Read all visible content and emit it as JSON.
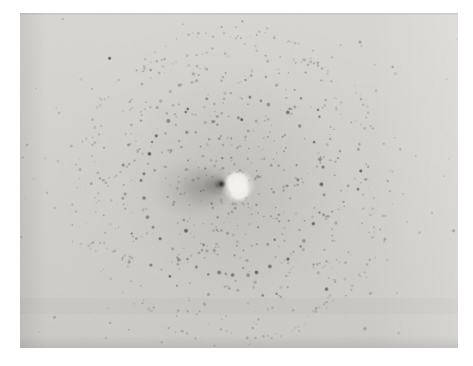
{
  "page": {
    "width": 473,
    "height": 366,
    "margin_color": "#ffffff"
  },
  "photo": {
    "description": "Black-and-white X-ray diffraction photograph: concentric and overlapping rings of small dark diffraction spots arranged with ten-fold rosette symmetry around a bright white beam-stop spot with a dark shadow smudge extending to its left, on a pale gray film plate with a white border",
    "rect": {
      "x": 20,
      "y": 13,
      "width": 438,
      "height": 335
    },
    "seed": 1337,
    "base_color_top": "#d7d6d3",
    "base_color_bottom": "#cbcac7",
    "spot_color": "45,45,42",
    "faint_spot_color": "82,82,78",
    "center": {
      "x": 233,
      "y": 186
    },
    "halo": [
      {
        "r": 115,
        "alpha": 0.1
      },
      {
        "r": 185,
        "alpha": 0.05
      }
    ],
    "rings": [
      {
        "r": 30,
        "count": 10,
        "rmin": 1.0,
        "rmax": 1.8,
        "amin": 0.2,
        "amax": 0.45,
        "jitter": 3.0,
        "skip": 0.15
      },
      {
        "r": 50,
        "count": 16,
        "rmin": 1.0,
        "rmax": 2.0,
        "amin": 0.22,
        "amax": 0.5,
        "jitter": 3.0,
        "skip": 0.15
      },
      {
        "r": 68,
        "count": 24,
        "rmin": 1.0,
        "rmax": 2.2,
        "amin": 0.22,
        "amax": 0.55,
        "jitter": 3.0,
        "skip": 0.15
      },
      {
        "r": 90,
        "count": 40,
        "rmin": 1.6,
        "rmax": 2.7,
        "amin": 0.4,
        "amax": 0.8,
        "jitter": 2.5,
        "skip": 0.1
      },
      {
        "r": 112,
        "count": 34,
        "rmin": 1.2,
        "rmax": 2.2,
        "amin": 0.25,
        "amax": 0.55,
        "jitter": 3.5,
        "skip": 0.18
      },
      {
        "r": 135,
        "count": 38,
        "rmin": 1.0,
        "rmax": 2.0,
        "amin": 0.18,
        "amax": 0.45,
        "jitter": 4.0,
        "skip": 0.22
      },
      {
        "r": 158,
        "count": 42,
        "rmin": 0.9,
        "rmax": 1.8,
        "amin": 0.14,
        "amax": 0.38,
        "jitter": 4.5,
        "skip": 0.25
      }
    ],
    "flower": {
      "petal_count": 10,
      "start_angle_deg": -72,
      "step_deg": 36,
      "center_distance": 76,
      "circle_radius": 80,
      "spots_per_circle": 46,
      "radial_jitter": 2.5,
      "rmin": 0.9,
      "rmax": 2.0,
      "amin": 0.16,
      "amax": 0.48
    },
    "falloff": {
      "flat_radius": 100,
      "slope_radius": 185,
      "min": 0.22
    },
    "scatter": {
      "count": 270,
      "sigma_x": 122,
      "sigma_y": 96,
      "rmin": 0.8,
      "rmax": 2.2,
      "amin": 0.12,
      "amax": 0.45
    },
    "dark_outliers": {
      "count": 10,
      "margin": 30,
      "rmin": 1.6,
      "rmax": 2.6,
      "amin": 0.5,
      "amax": 0.78
    },
    "featured_spots": [
      {
        "x": 358,
        "y": 208,
        "rx": 4.5,
        "ry": 2.6,
        "a": 0.72
      },
      {
        "x": 389,
        "y": 74,
        "rx": 2.2,
        "ry": 2.2,
        "a": 0.6
      },
      {
        "x": 64,
        "y": 152,
        "rx": 2.3,
        "ry": 2.3,
        "a": 0.55
      },
      {
        "x": 427,
        "y": 44,
        "rx": 2.0,
        "ry": 2.0,
        "a": 0.5
      },
      {
        "x": 106,
        "y": 55,
        "rx": 2.2,
        "ry": 2.2,
        "a": 0.6
      },
      {
        "x": 84,
        "y": 287,
        "rx": 2.2,
        "ry": 2.2,
        "a": 0.5
      },
      {
        "x": 300,
        "y": 63,
        "rx": 2.4,
        "ry": 2.4,
        "a": 0.65
      },
      {
        "x": 180,
        "y": 60,
        "rx": 2.2,
        "ry": 2.2,
        "a": 0.58
      },
      {
        "x": 250,
        "y": 330,
        "rx": 2.0,
        "ry": 2.0,
        "a": 0.45
      },
      {
        "x": 430,
        "y": 310,
        "rx": 1.8,
        "ry": 1.8,
        "a": 0.35
      }
    ],
    "shadow_blobs": [
      {
        "x": 193,
        "y": 189,
        "rx": 42,
        "ry": 30,
        "a": 0.16,
        "color": "70,70,66"
      },
      {
        "x": 207,
        "y": 187,
        "rx": 28,
        "ry": 22,
        "a": 0.22,
        "color": "70,70,66"
      },
      {
        "x": 217,
        "y": 185,
        "rx": 14,
        "ry": 12,
        "a": 0.3,
        "color": "60,60,56"
      },
      {
        "x": 221,
        "y": 184,
        "rx": 7,
        "ry": 6,
        "a": 0.5,
        "color": "40,40,36"
      },
      {
        "x": 222,
        "y": 184,
        "rx": 4,
        "ry": 3.5,
        "a": 0.88,
        "color": "20,20,18"
      }
    ],
    "beam_stop": {
      "color": "243,242,237",
      "blobs": [
        {
          "x": 237,
          "y": 183,
          "r": 12,
          "a": 0.97
        },
        {
          "x": 239,
          "y": 190,
          "r": 11,
          "a": 0.97
        },
        {
          "x": 238,
          "y": 186,
          "r": 17,
          "a": 0.55
        }
      ]
    },
    "edges": {
      "left_dark_width": 26,
      "left_dark_alpha": 0.1,
      "right_light_start": 372,
      "right_light_alpha": 0.18,
      "bottom_dark_start": 336,
      "bottom_dark_alpha": 0.11,
      "top_line_alpha": 0.1,
      "band_y": 298,
      "band_h": 16,
      "band_alpha": 0.025
    },
    "noise": {
      "dark_count": 3200,
      "dark_alpha": 0.05,
      "light_count": 1600,
      "light_alpha": 0.07
    }
  }
}
